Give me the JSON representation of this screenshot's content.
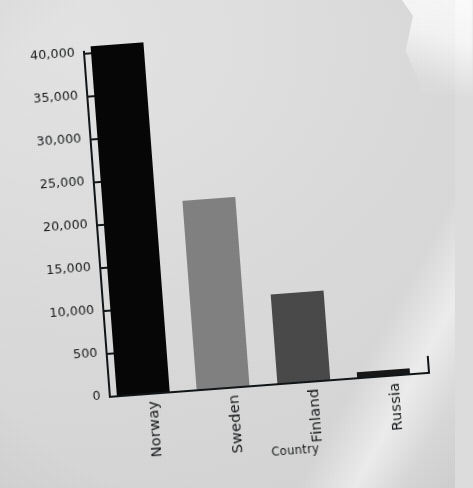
{
  "chart_data": {
    "type": "bar",
    "title": "",
    "subtitle": "",
    "xlabel": "Country",
    "ylabel": "",
    "categories": [
      "Norway",
      "Sweden",
      "Finland",
      "Russia"
    ],
    "values": [
      40700,
      22000,
      10300,
      600
    ],
    "series": [
      {
        "name": "",
        "values": [
          40700,
          22000,
          10300,
          600
        ]
      }
    ],
    "bar_colors": [
      "#0a0a0a",
      "#808080",
      "#4a4a4a",
      "#1a1a1a"
    ],
    "ylim": [
      0,
      42000
    ],
    "ytick_labels": [
      "40,000",
      "35,000",
      "30,000",
      "25,000",
      "20,000",
      "15,000",
      "10,000",
      "500",
      "0"
    ],
    "ytick_values": [
      40000,
      35000,
      30000,
      25000,
      20000,
      15000,
      10000,
      5000,
      0
    ],
    "grid": false,
    "legend": "none",
    "xtick_rotation": "-90"
  },
  "axis": {
    "x_title": "Country"
  },
  "ticks": {
    "t0": "40,000",
    "t1": "35,000",
    "t2": "30,000",
    "t3": "25,000",
    "t4": "20,000",
    "t5": "15,000",
    "t6": "10,000",
    "t7": "500",
    "t8": "0"
  },
  "categories": {
    "c0": "Norway",
    "c1": "Sweden",
    "c2": "Finland",
    "c3": "Russia"
  },
  "colors": {
    "background": "#dcdcdc",
    "ink": "#15181a",
    "bar_norway": "#0a0a0a",
    "bar_sweden": "#808080",
    "bar_finland": "#4a4a4a",
    "bar_russia": "#1a1a1a"
  }
}
